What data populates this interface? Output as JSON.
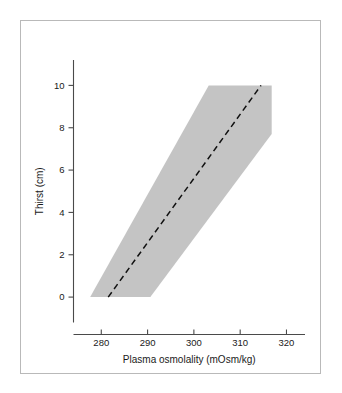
{
  "figure": {
    "background_color": "#ffffff",
    "border_color": "#b9b9b9"
  },
  "chart_data": {
    "type": "line",
    "title": "",
    "subtitle": "",
    "xlabel": "Plasma osmolality (mOsm/kg)",
    "ylabel": "Thirst (cm)",
    "xlim": [
      274,
      324
    ],
    "ylim": [
      -1.2,
      11.2
    ],
    "xticks": [
      280,
      290,
      300,
      310,
      320
    ],
    "xticklabels": [
      "280",
      "290",
      "300",
      "310",
      "320"
    ],
    "yticks": [
      0,
      2,
      4,
      6,
      8,
      10
    ],
    "yticklabels": [
      "0",
      "2",
      "4",
      "6",
      "8",
      "10"
    ],
    "grid": false,
    "legend": null,
    "legend_position": "none",
    "series": [
      {
        "name": "Regression line",
        "style": "dashed",
        "color": "#111111",
        "x": [
          281.5,
          314.5
        ],
        "y": [
          0,
          10
        ]
      },
      {
        "name": "95% confidence band",
        "style": "filled-polygon",
        "color": "#c4c4c4",
        "polygon_x": [
          277.6,
          290.6,
          316.8,
          316.8,
          303.2
        ],
        "polygon_y": [
          0,
          0,
          7.7,
          10,
          10
        ]
      }
    ],
    "annotations": []
  },
  "axis": {
    "x_tick_values": [
      "280",
      "290",
      "300",
      "310",
      "320"
    ],
    "y_tick_values": [
      "0",
      "2",
      "4",
      "6",
      "8",
      "10"
    ],
    "x_title": "Plasma osmolality (mOsm/kg)",
    "y_title": "Thirst (cm)"
  },
  "colors": {
    "band": "#c4c4c4",
    "line": "#111111",
    "axis": "#4a4a4a",
    "text": "#1a1a1a",
    "border": "#b9b9b9"
  }
}
